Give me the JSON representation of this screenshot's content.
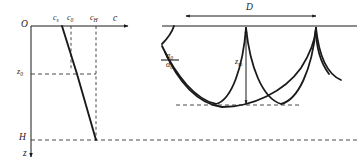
{
  "figure": {
    "stroke_color": "#1a1a1a",
    "dash_color": "#333333"
  },
  "left_panel": {
    "name": "sound-speed-profile",
    "origin_label": "O",
    "horizontal_axis_label": "c",
    "vertical_axis_label": "z",
    "speed_ticks": [
      {
        "id": "c_s",
        "label": "c",
        "sub": "s"
      },
      {
        "id": "c_0",
        "label": "c",
        "sub": "0"
      },
      {
        "id": "c_H",
        "label": "c",
        "sub": "H"
      }
    ],
    "depth_ticks": [
      {
        "id": "z_0",
        "label": "z",
        "sub": "0"
      },
      {
        "id": "H",
        "label": "H",
        "sub": ""
      }
    ]
  },
  "right_panel": {
    "name": "ray-diagram",
    "range_label": "D",
    "depth_label": {
      "label": "z",
      "sub": "m"
    },
    "angle_labels": [
      {
        "id": "alpha_upper",
        "label": "α",
        "sub": "0"
      },
      {
        "id": "alpha_lower",
        "label": "α",
        "sub": "0"
      }
    ]
  }
}
